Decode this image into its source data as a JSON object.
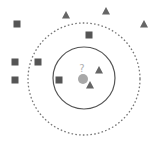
{
  "colors": {
    "square": "#555555",
    "triangle": "#666666",
    "query": "#a8a8a8",
    "inner_circle": "#555555",
    "outer_circle": "#777777",
    "question": "#b0b0b0"
  },
  "query_point": {
    "x": 83,
    "y": 79,
    "r": 5,
    "label": "?"
  },
  "inner_circle": {
    "cx": 84,
    "cy": 78,
    "r": 31,
    "style": "solid",
    "label": "k=3"
  },
  "outer_circle": {
    "cx": 84,
    "cy": 79,
    "r": 56,
    "style": "dashed",
    "label": "k=5"
  },
  "squares": [
    {
      "x": 17,
      "y": 24
    },
    {
      "x": 89,
      "y": 35
    },
    {
      "x": 15,
      "y": 62
    },
    {
      "x": 38,
      "y": 62
    },
    {
      "x": 15,
      "y": 80
    },
    {
      "x": 59,
      "y": 80
    }
  ],
  "triangles": [
    {
      "x": 66,
      "y": 15
    },
    {
      "x": 106,
      "y": 11
    },
    {
      "x": 144,
      "y": 24
    },
    {
      "x": 99,
      "y": 70
    },
    {
      "x": 90,
      "y": 85
    }
  ]
}
